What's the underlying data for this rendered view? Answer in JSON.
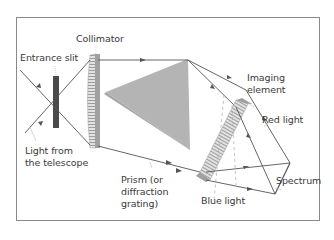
{
  "labels": {
    "collimator": "Collimator",
    "entrance_slit": "Entrance slit",
    "light_from_telescope_1": "Light from",
    "light_from_telescope_2": "the telescope",
    "prism_1": "Prism (or",
    "prism_2": "diffraction",
    "prism_3": "grating)",
    "imaging_1": "Imaging",
    "imaging_2": "element",
    "red_light": "Red light",
    "blue_light": "Blue light",
    "spectrum": "Spectrum"
  },
  "colors": {
    "frame": "#8a8a8a",
    "prism_fill": "#b4b4b4",
    "slit_fill": "#4a4a4a",
    "lens_fill": "#c8c8c8",
    "ray": "#555555",
    "text": "#3a3a3a"
  }
}
